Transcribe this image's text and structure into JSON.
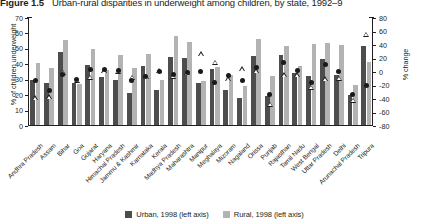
{
  "figure": {
    "number": "Figure 1.5",
    "title": "Urban-rural disparities in underweight among children, by state, 1992–9"
  },
  "legend": {
    "items": [
      {
        "key": "urban",
        "label": "Urban, 1998 (left axis)",
        "color": "#4d4d4d"
      },
      {
        "key": "rural",
        "label": "Rural, 1998 (left axis)",
        "color": "#b3b3b3"
      }
    ]
  },
  "chart_data": {
    "type": "bar",
    "title": "Urban-rural disparities in underweight among children, by state, 1992–9",
    "xlabel": "",
    "ylabel": "% of children underweight",
    "y2label": "% change",
    "ylim": [
      0,
      70
    ],
    "y2lim": [
      -80,
      80
    ],
    "yticks": [
      0,
      10,
      20,
      30,
      40,
      50,
      60,
      70
    ],
    "y2ticks": [
      80,
      60,
      40,
      20,
      0,
      -20,
      -40,
      -60,
      -80
    ],
    "grid": false,
    "legend_position": "bottom",
    "categories": [
      "Andhra Pradesh",
      "Assam",
      "Bihar",
      "Goa",
      "Gujarat",
      "Haryana",
      "Himachal Pradesh",
      "Jammu & Kashmir",
      "Karnataka",
      "Kerala",
      "Madhya Pradesh",
      "Maharashtra",
      "Manipur",
      "Meghalaya",
      "Mizoram",
      "Nagaland",
      "Orissa",
      "Punjab",
      "Rajasthan",
      "Tamil Nadu",
      "West Bengal",
      "Uttar Pradesh",
      "Delhi",
      "Arunachal Pradesh",
      "Tripura"
    ],
    "series": [
      {
        "name": "Urban, 1998 (left axis)",
        "axis": "left",
        "type": "bar",
        "color": "#4d4d4d",
        "values": [
          29,
          27,
          47.5,
          27,
          39,
          31,
          29.5,
          20.5,
          38.5,
          23,
          44,
          43.5,
          27.5,
          36.5,
          23,
          17.5,
          44.5,
          19,
          45.5,
          33.5,
          32,
          42.5,
          32.5,
          19.5,
          51.5
        ]
      },
      {
        "name": "Rural, 1998 (left axis)",
        "axis": "left",
        "type": "bar",
        "color": "#b3b3b3",
        "values": [
          40.5,
          37,
          55,
          26.5,
          49,
          35.5,
          45.5,
          37,
          46,
          29,
          58,
          54,
          28.5,
          37.5,
          32.5,
          25,
          56,
          32,
          51.5,
          38.5,
          52.5,
          53,
          52,
          26,
          41
        ]
      },
      {
        "name": "% change, urban",
        "axis": "right",
        "type": "scatter",
        "marker": "filled-circle",
        "color": "#1a1a1a",
        "values": [
          -12,
          -28,
          -3,
          -11,
          4,
          3,
          2,
          -13,
          -7,
          1,
          -4,
          0,
          1,
          -16,
          -5,
          -13,
          6,
          -34,
          14,
          2,
          -16,
          11,
          1,
          -33,
          -20
        ]
      },
      {
        "name": "% change, rural",
        "axis": "right",
        "type": "scatter",
        "marker": "open-triangle",
        "color": "#1a1a1a",
        "values": [
          -38,
          -37,
          0,
          -12,
          -8,
          2,
          1,
          -8,
          -7,
          2,
          -6,
          -1,
          27,
          14,
          -10,
          5,
          2,
          -48,
          -4,
          -4,
          -23,
          -10,
          -9,
          -42,
          56
        ]
      }
    ]
  }
}
